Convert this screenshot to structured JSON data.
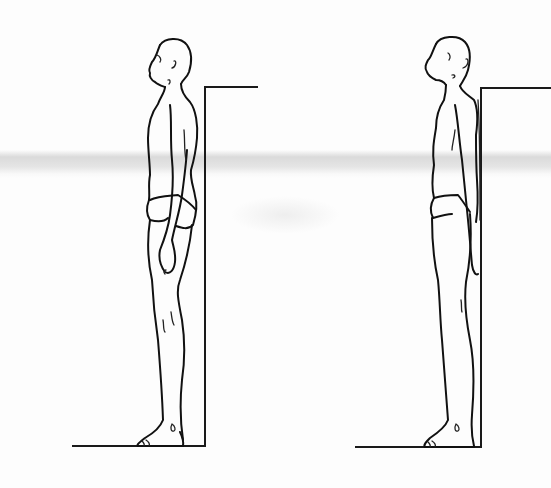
{
  "illustration": {
    "subject": "posture comparison line drawing",
    "panels": [
      {
        "id": "left",
        "description": "man standing in side profile, head forward, beside wall",
        "wall_x": 205,
        "wall_top_y": 87,
        "floor_y": 446,
        "floor_left_x": 72,
        "wall_cap_right_x": 258
      },
      {
        "id": "right",
        "description": "man standing in side profile, back and head against wall, chin lifted",
        "wall_x": 481,
        "wall_top_y": 88,
        "floor_y": 447,
        "floor_left_x": 355,
        "wall_cap_right_x": 551
      }
    ],
    "colors": {
      "ink": "#111111",
      "paper": "#fdfdfd",
      "scan_band": "#c8c8c8"
    }
  }
}
